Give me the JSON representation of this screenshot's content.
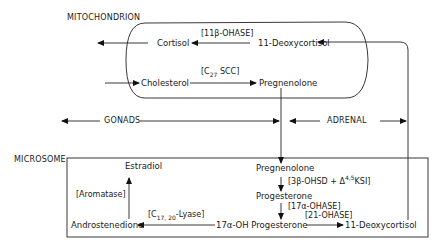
{
  "compartments": {
    "mitochondrion": "MITOCHONDRION",
    "microsome": "MICROSOME"
  },
  "tissues": {
    "gonads": "GONADS",
    "adrenal": "ADRENAL"
  },
  "mitochondrion_nodes": {
    "cortisol": "Cortisol",
    "deoxycortisol": "11-Deoxycortisol",
    "cholesterol": "Cholesterol",
    "pregnenolone": "Pregnenolone"
  },
  "mitochondrion_enzymes": {
    "hydroxylase_11b": "[11β-OHASE]",
    "scc_prefix": "[C",
    "scc_sub": "27",
    "scc_suffix": " SCC]"
  },
  "microsome_nodes": {
    "estradiol": "Estradiol",
    "pregnenolone": "Pregnenolone",
    "progesterone": "Progesterone",
    "androstenedione": "Androstenedione",
    "oh_progesterone": "17α-OH Progesterone",
    "deoxycortisol": "11-Deoxycortisol"
  },
  "microsome_enzymes": {
    "aromatase": "[Aromatase]",
    "hsd_prefix": "[3β-OHSD + Δ",
    "hsd_sup": "4,5",
    "hsd_suffix": "KSI]",
    "hydroxylase_17a": "[17α-OHASE]",
    "lyase_prefix": "[C",
    "lyase_sub": "17, 20",
    "lyase_suffix": "-Lyase]",
    "hydroxylase_21": "[21-OHASE]"
  }
}
